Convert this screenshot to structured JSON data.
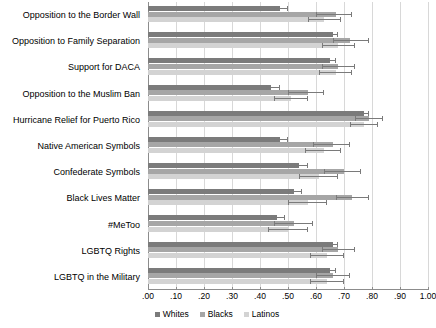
{
  "chart_data": {
    "type": "bar",
    "orientation": "horizontal",
    "title": "",
    "subtitle": "",
    "xlabel": "",
    "ylabel": "",
    "xlim": [
      0.0,
      1.0
    ],
    "grid": true,
    "legend_position": "bottom-center",
    "error_bars": true,
    "categories": [
      "Opposition to the Border Wall",
      "Opposition to Family Separation",
      "Support for DACA",
      "Opposition to the Muslim Ban",
      "Hurricane Relief for Puerto Rico",
      "Native American Symbols",
      "Confederate Symbols",
      "Black Lives Matter",
      "#MeToo",
      "LGBTQ Rights",
      "LGBTQ in the Military"
    ],
    "tick_labels": [
      ".00",
      ".10",
      ".20",
      ".30",
      ".40",
      ".50",
      ".60",
      ".70",
      ".80",
      ".90",
      "1.00"
    ],
    "tick_values": [
      0.0,
      0.1,
      0.2,
      0.3,
      0.4,
      0.5,
      0.6,
      0.7,
      0.8,
      0.9,
      1.0
    ],
    "series": [
      {
        "name": "Whites",
        "color": "#7b7b7b",
        "values": [
          0.47,
          0.66,
          0.65,
          0.44,
          0.77,
          0.47,
          0.54,
          0.52,
          0.46,
          0.66,
          0.65
        ],
        "ci_low": [
          0.45,
          0.64,
          0.63,
          0.42,
          0.75,
          0.45,
          0.52,
          0.5,
          0.44,
          0.64,
          0.63
        ],
        "ci_high": [
          0.5,
          0.68,
          0.67,
          0.47,
          0.79,
          0.5,
          0.57,
          0.55,
          0.49,
          0.68,
          0.67
        ]
      },
      {
        "name": "Blacks",
        "color": "#a6a6a6",
        "values": [
          0.67,
          0.72,
          0.68,
          0.57,
          0.79,
          0.66,
          0.7,
          0.73,
          0.52,
          0.68,
          0.66
        ],
        "ci_low": [
          0.6,
          0.66,
          0.62,
          0.5,
          0.74,
          0.59,
          0.63,
          0.67,
          0.45,
          0.62,
          0.6
        ],
        "ci_high": [
          0.73,
          0.79,
          0.74,
          0.63,
          0.84,
          0.72,
          0.76,
          0.79,
          0.59,
          0.74,
          0.72
        ]
      },
      {
        "name": "Latinos",
        "color": "#d3d3d3",
        "values": [
          0.63,
          0.68,
          0.67,
          0.51,
          0.77,
          0.63,
          0.61,
          0.57,
          0.5,
          0.64,
          0.64
        ],
        "ci_low": [
          0.57,
          0.62,
          0.61,
          0.45,
          0.72,
          0.56,
          0.54,
          0.5,
          0.43,
          0.58,
          0.58
        ],
        "ci_high": [
          0.69,
          0.74,
          0.73,
          0.57,
          0.82,
          0.69,
          0.68,
          0.64,
          0.57,
          0.7,
          0.7
        ]
      }
    ]
  },
  "legend": {
    "items": [
      {
        "label": "Whites",
        "color": "#7b7b7b"
      },
      {
        "label": "Blacks",
        "color": "#a6a6a6"
      },
      {
        "label": "Latinos",
        "color": "#d3d3d3"
      }
    ]
  },
  "colors": {
    "whites": "#7b7b7b",
    "blacks": "#a6a6a6",
    "latinos": "#d3d3d3",
    "grid": "#d8d8d8",
    "axis": "#8c8c8c",
    "background": "#ffffff",
    "text": "#000000"
  }
}
